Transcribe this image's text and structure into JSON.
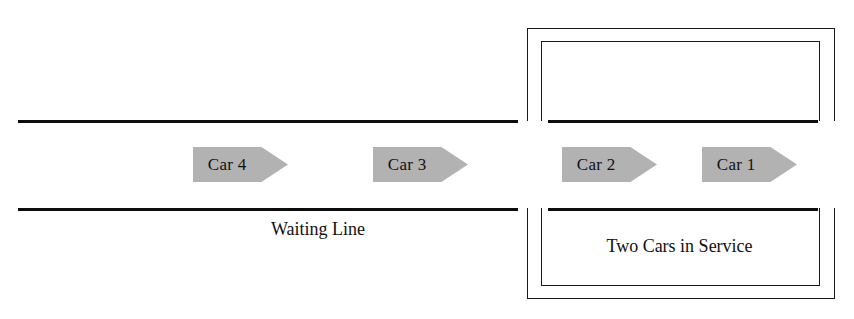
{
  "diagram": {
    "type": "queueing-system-schematic",
    "colors": {
      "car_fill": "#b2b2b2",
      "line": "#0d0d0d",
      "bracket": "#1a1a1a",
      "text": "#111111",
      "background": "#ffffff"
    },
    "cars": [
      {
        "label": "Car 4",
        "position": 4,
        "zone": "waiting-line",
        "x": 193,
        "y": 147,
        "width": 95
      },
      {
        "label": "Car 3",
        "position": 3,
        "zone": "waiting-line",
        "x": 373,
        "y": 147,
        "width": 95
      },
      {
        "label": "Car 2",
        "position": 2,
        "zone": "service",
        "x": 562,
        "y": 147,
        "width": 95
      },
      {
        "label": "Car 1",
        "position": 1,
        "zone": "service",
        "x": 702,
        "y": 147,
        "width": 95
      }
    ],
    "labels": [
      {
        "text": "Waiting Line",
        "name": "waiting-line-label"
      },
      {
        "text": "Two Cars in Service",
        "name": "service-area-label"
      }
    ],
    "roads": {
      "top_line_y": 120,
      "bottom_line_y": 208,
      "start_x": 18,
      "end_x": 833,
      "gap_start_x": 518,
      "gap_end_x": 548
    },
    "service_bay": {
      "outer_left_x": 527,
      "outer_right_x": 833,
      "inner_left_x": 541,
      "inner_right_x": 818,
      "top_outer_y": 28,
      "top_inner_y": 41,
      "bottom_outer_y": 298,
      "bottom_inner_y": 285
    }
  }
}
